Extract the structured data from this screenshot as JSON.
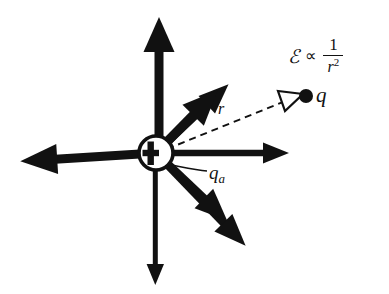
{
  "figure": {
    "background_color": "#ffffff",
    "ink_color": "#111111",
    "labels": {
      "test_charge": "q",
      "source_charge_base": "q",
      "source_charge_subscript": "a",
      "distance": "r",
      "formula_field_symbol": "ℰ",
      "formula_proportional": "∝",
      "formula_numerator": "1",
      "formula_denominator_base": "r",
      "formula_denominator_exponent": "2",
      "plus_sign": "+"
    },
    "center_charge": {
      "cx": 156,
      "cy": 153,
      "radius": 17,
      "fill": "#ffffff",
      "stroke": "#111111",
      "stroke_width": 3.4,
      "sign": "+"
    },
    "field_arrows": [
      {
        "name": "arrow-up",
        "angle_deg": 270,
        "tip_x": 159,
        "tip_y": 17,
        "shaft_width": 9,
        "head_width": 30,
        "head_length": 34
      },
      {
        "name": "arrow-upper-right",
        "angle_deg": 317,
        "tip_x": 259,
        "tip_y": 63,
        "shaft_width": 7.5,
        "head_width": 24,
        "head_length": 28
      },
      {
        "name": "arrow-right",
        "angle_deg": 0,
        "tip_x": 289,
        "tip_y": 153,
        "shaft_width": 6.5,
        "head_width": 21,
        "head_length": 24
      },
      {
        "name": "arrow-lower-right",
        "angle_deg": 45,
        "tip_x": 249,
        "tip_y": 252,
        "shaft_width": 8,
        "head_width": 25,
        "head_length": 28
      },
      {
        "name": "arrow-down",
        "angle_deg": 90,
        "tip_x": 155,
        "tip_y": 285,
        "shaft_width": 5,
        "head_width": 17,
        "head_length": 20
      },
      {
        "name": "arrow-lower-left",
        "angle_deg": 135,
        "tip_x": 62,
        "tip_y": 245,
        "shaft_width": 9.5,
        "head_width": 30,
        "head_length": 33
      },
      {
        "name": "arrow-left",
        "angle_deg": 180,
        "tip_x": 18,
        "tip_y": 148,
        "shaft_width": 9,
        "head_width": 30,
        "head_length": 33
      },
      {
        "name": "arrow-upper-left",
        "angle_deg": 224,
        "tip_x": 55,
        "tip_y": 56,
        "shaft_width": 8.5,
        "head_width": 27,
        "head_length": 30
      }
    ],
    "radius_vector": {
      "name": "dashed-radius-line",
      "from_x": 167,
      "from_y": 148,
      "to_x": 290,
      "to_y": 98,
      "dash_pattern": "7,5",
      "stroke_width": 1.8,
      "arrowhead": "hollow-triangle"
    },
    "test_charge_dot": {
      "cx": 306,
      "cy": 96,
      "radius": 7,
      "fill": "#111111"
    },
    "leader_line": {
      "name": "qa-leader-line",
      "from_x": 208,
      "from_y": 172,
      "to_x": 170,
      "to_y": 166,
      "stroke_width": 1.6
    }
  }
}
